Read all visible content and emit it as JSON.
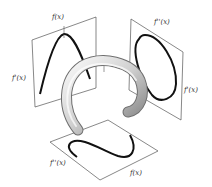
{
  "figure": {
    "panels": {
      "left": {
        "top_label": "f(x)",
        "side_label": "f'(x)"
      },
      "right": {
        "top_label": "f''(x)",
        "side_label": "f'(x)"
      },
      "bottom": {
        "left_label": "f''(x)",
        "right_label": "f(x)"
      }
    },
    "colors": {
      "plane_edge": "#555555",
      "curve": "#111111",
      "tube_light": "#f0f0f0",
      "tube_dark": "#8a8a8a"
    }
  }
}
